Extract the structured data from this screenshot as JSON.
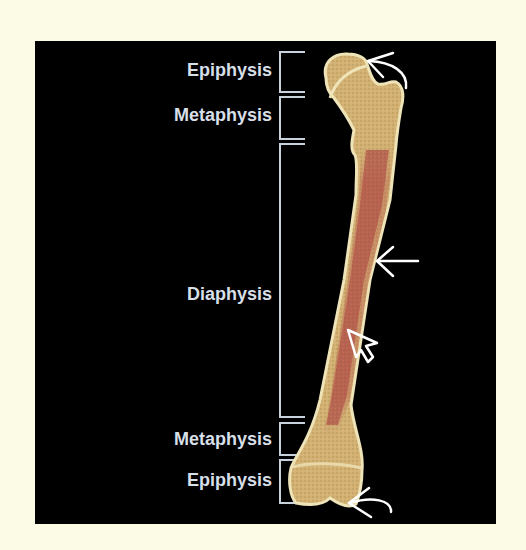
{
  "figure": {
    "colors": {
      "background": "#fcfce6",
      "panel": "#000000",
      "label_text": "#d7dfe8",
      "bracket": "#c8d2dc",
      "bone_spongy": "#d6b57a",
      "bone_outline": "#efe3b8",
      "marrow": "#b0574a",
      "arrow": "#ffffff"
    },
    "labels": [
      {
        "id": "proximal-epiphysis",
        "text": "Epiphysis",
        "y_top": 52,
        "y_bottom": 92
      },
      {
        "id": "proximal-metaphysis",
        "text": "Metaphysis",
        "y_top": 97,
        "y_bottom": 139
      },
      {
        "id": "diaphysis",
        "text": "Diaphysis",
        "y_top": 144,
        "y_bottom": 417
      },
      {
        "id": "distal-metaphysis",
        "text": "Metaphysis",
        "y_top": 423,
        "y_bottom": 455
      },
      {
        "id": "distal-epiphysis",
        "text": "Epiphysis",
        "y_top": 460,
        "y_bottom": 503
      }
    ],
    "arrows": [
      {
        "id": "proximal-articular-arrow",
        "type": "curved-line-arrow",
        "points_to": "femoral head surface"
      },
      {
        "id": "shaft-arrow",
        "type": "straight-line-arrow",
        "points_to": "diaphysis outer surface"
      },
      {
        "id": "medullary-arrow",
        "type": "hollow-block-arrow",
        "points_to": "medullary cavity"
      },
      {
        "id": "distal-articular-arrow",
        "type": "curved-line-arrow",
        "points_to": "distal articular surface"
      }
    ]
  }
}
